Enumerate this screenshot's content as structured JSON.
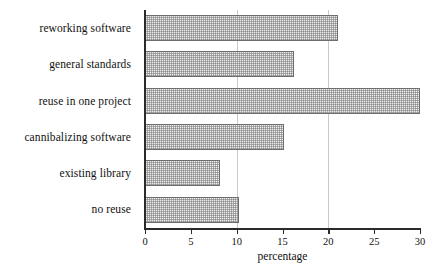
{
  "chart_data": {
    "type": "bar",
    "orientation": "horizontal",
    "title": "",
    "subtitle": "",
    "xlabel": "percentage",
    "ylabel": "",
    "categories": [
      "reworking software",
      "general standards",
      "reuse in one project",
      "cannibalizing software",
      "existing library",
      "no reuse"
    ],
    "values": [
      21.0,
      16.3,
      30.0,
      15.2,
      8.2,
      10.2
    ],
    "xlim": [
      0,
      30
    ],
    "xticks": [
      0,
      5,
      10,
      15,
      20,
      25,
      30
    ],
    "xtick_labels": [
      "0",
      "5",
      "10",
      "15",
      "20",
      "25",
      "30"
    ],
    "gridlines_at": [
      10,
      20
    ],
    "grid": true,
    "legend": false,
    "bar_fill": "#eeeeee",
    "bar_edge": "#6e6e6e",
    "axis_color": "#2b2b2b",
    "grid_color": "#c9c9c9"
  },
  "caption": {
    "fragment": ""
  }
}
